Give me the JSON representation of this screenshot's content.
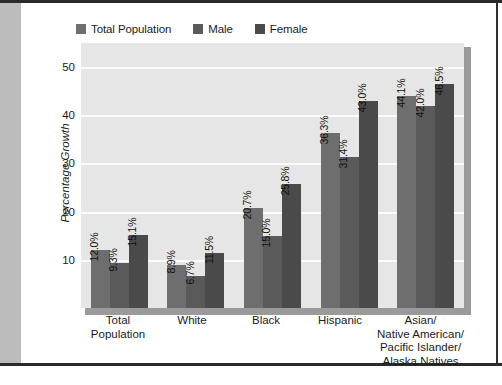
{
  "chart_data": {
    "type": "bar",
    "title": "",
    "subtitle": "",
    "xlabel": "",
    "ylabel": "Percentage Growth",
    "ylim": [
      0,
      55
    ],
    "yticks": [
      10,
      20,
      30,
      40,
      50
    ],
    "ytick_labels": [
      "10",
      "20",
      "30",
      "40",
      "50"
    ],
    "grid": true,
    "grid_axis": "y",
    "legend_position": "top-left",
    "value_label_suffix": "%",
    "value_labels_rotated": true,
    "categories": [
      "Total Population",
      "White",
      "Black",
      "Hispanic",
      "Asian/ Native American/ Pacific Islander/ Alaska Natives"
    ],
    "category_lines": [
      [
        "Total",
        "Population"
      ],
      [
        "White"
      ],
      [
        "Black"
      ],
      [
        "Hispanic"
      ],
      [
        "Asian/",
        "Native American/",
        "Pacific Islander/",
        "Alaska Natives"
      ]
    ],
    "series": [
      {
        "name": "Total Population",
        "color": "#6e6e6e",
        "values": [
          12.0,
          8.9,
          20.7,
          36.3,
          44.1
        ],
        "labels": [
          "12.0%",
          "8.9%",
          "20.7%",
          "36.3%",
          "44.1%"
        ]
      },
      {
        "name": "Male",
        "color": "#5a5a5a",
        "values": [
          9.3,
          6.7,
          15.0,
          31.4,
          42.0
        ],
        "labels": [
          "9.3%",
          "6.7%",
          "15.0%",
          "31.4%",
          "42.0%"
        ]
      },
      {
        "name": "Female",
        "color": "#4a4a4a",
        "values": [
          15.1,
          11.5,
          25.8,
          43.0,
          46.5
        ],
        "labels": [
          "15.1%",
          "11.5%",
          "25.8%",
          "43.0%",
          "46.5%"
        ]
      }
    ]
  },
  "colors": {
    "plot_background": "#e6e6e6",
    "gridline": "#fbfbfb",
    "plot_shadow": "#9a9a9a",
    "frame_rule": "#2b2b2b",
    "left_margin_gray": "#bcbcbc",
    "text": "#1b1b1b"
  }
}
